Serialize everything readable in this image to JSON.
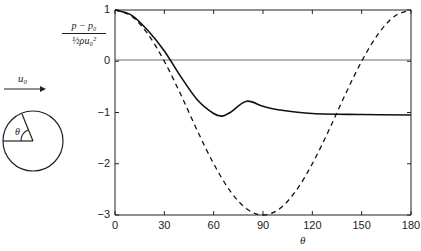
{
  "chart_data": {
    "type": "line",
    "title": "",
    "xlabel": "θ",
    "ylabel_numerator": "p − p₀",
    "ylabel_denominator": "½ρu₀²",
    "xlim": [
      0,
      180
    ],
    "ylim": [
      -3,
      1
    ],
    "x_ticks": [
      "0",
      "30",
      "60",
      "90",
      "120",
      "150",
      "180"
    ],
    "y_ticks": [
      "1",
      "0",
      "−1",
      "−2",
      "−3"
    ],
    "grid": false,
    "reference_line_y": 0,
    "series": [
      {
        "name": "measured (solid)",
        "style": "solid",
        "x": [
          0,
          10,
          20,
          30,
          40,
          50,
          60,
          65,
          70,
          80,
          90,
          100,
          120,
          150,
          180
        ],
        "y": [
          1.0,
          0.9,
          0.6,
          0.2,
          -0.3,
          -0.75,
          -1.02,
          -1.07,
          -1.0,
          -0.78,
          -0.88,
          -0.95,
          -1.02,
          -1.04,
          -1.05
        ]
      },
      {
        "name": "potential flow 1 − 4sin²θ (dashed)",
        "style": "dashed",
        "x": [
          0,
          10,
          20,
          30,
          40,
          50,
          60,
          70,
          80,
          90,
          100,
          110,
          120,
          130,
          140,
          150,
          160,
          170,
          180
        ],
        "y": [
          1.0,
          0.88,
          0.53,
          0.0,
          -0.65,
          -1.35,
          -2.0,
          -2.53,
          -2.88,
          -3.0,
          -2.88,
          -2.53,
          -2.0,
          -1.35,
          -0.65,
          0.0,
          0.53,
          0.88,
          1.0
        ]
      }
    ]
  },
  "diagram": {
    "flow_label": "u₀",
    "angle_label": "θ"
  }
}
